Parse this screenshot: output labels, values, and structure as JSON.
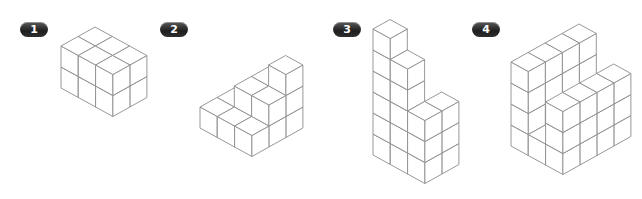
{
  "figures": [
    {
      "label": "1",
      "badge": {
        "x": 20,
        "y": 22
      },
      "origin": [
        61,
        88
      ],
      "description": "3 x 2 x 2 rectangular block of cubes",
      "heights": [
        [
          2,
          2
        ],
        [
          2,
          2
        ],
        [
          2,
          2
        ]
      ]
    },
    {
      "label": "2",
      "badge": {
        "x": 160,
        "y": 22
      },
      "origin": [
        200,
        128
      ],
      "description": "stepped pyramid of cubes",
      "heights": [
        [
          1,
          1,
          1
        ],
        [
          1,
          2,
          2
        ],
        [
          1,
          2,
          3
        ]
      ]
    },
    {
      "label": "3",
      "badge": {
        "x": 333,
        "y": 22
      },
      "origin": [
        373,
        155
      ],
      "description": "staircase tower of cubes",
      "heights": [
        [
          6,
          0
        ],
        [
          5,
          0
        ],
        [
          3,
          3
        ]
      ]
    },
    {
      "label": "4",
      "badge": {
        "x": 472,
        "y": 22
      },
      "origin": [
        511,
        146
      ],
      "description": "L-shaped structure of cubes with notch",
      "heights": [
        [
          4,
          4,
          4,
          4
        ],
        [
          1,
          1,
          1,
          1
        ],
        [
          3,
          3,
          3,
          3
        ]
      ]
    }
  ],
  "iso": {
    "ux": [
      17.3,
      9.5
    ],
    "uy": [
      17.0,
      -9.5
    ],
    "uz": [
      0,
      -21
    ]
  },
  "colors": {
    "stroke": "#8c8c8c",
    "face": "#ffffff",
    "badge": "#2a2a2a",
    "badge_text": "#ffffff"
  }
}
